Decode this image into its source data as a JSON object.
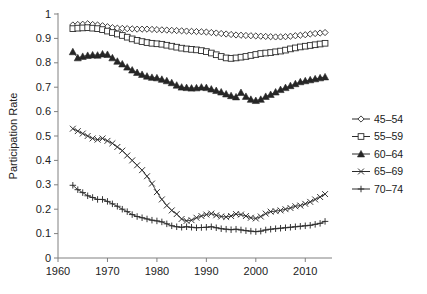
{
  "chart_data": {
    "type": "line",
    "title": "",
    "xlabel": "",
    "ylabel": "Participation Rate",
    "xlim": [
      1960,
      2015
    ],
    "ylim": [
      0,
      1
    ],
    "xticks": [
      1960,
      1970,
      1980,
      1990,
      2000,
      2010
    ],
    "yticks": [
      0,
      0.1,
      0.2,
      0.3,
      0.4,
      0.5,
      0.6,
      0.7,
      0.8,
      0.9,
      1
    ],
    "ytick_labels": [
      "0",
      "0.1",
      "0.2",
      "0.3",
      "0.4",
      "0.5",
      "0.6",
      "0.7",
      "0.8",
      "0.9",
      "1"
    ],
    "xtick_labels": [
      "1960",
      "1970",
      "1980",
      "1990",
      "2000",
      "2010"
    ],
    "grid": false,
    "legend_position": "right",
    "x": [
      1963,
      1964,
      1965,
      1966,
      1967,
      1968,
      1969,
      1970,
      1971,
      1972,
      1973,
      1974,
      1975,
      1976,
      1977,
      1978,
      1979,
      1980,
      1981,
      1982,
      1983,
      1984,
      1985,
      1986,
      1987,
      1988,
      1989,
      1990,
      1991,
      1992,
      1993,
      1994,
      1995,
      1996,
      1997,
      1998,
      1999,
      2000,
      2001,
      2002,
      2003,
      2004,
      2005,
      2006,
      2007,
      2008,
      2009,
      2010,
      2011,
      2012,
      2013,
      2014
    ],
    "series": [
      {
        "name": "45–54",
        "marker": "open-diamond",
        "values": [
          0.955,
          0.957,
          0.958,
          0.96,
          0.957,
          0.955,
          0.952,
          0.948,
          0.944,
          0.942,
          0.941,
          0.94,
          0.939,
          0.938,
          0.938,
          0.938,
          0.937,
          0.936,
          0.935,
          0.934,
          0.933,
          0.932,
          0.931,
          0.93,
          0.929,
          0.928,
          0.927,
          0.926,
          0.924,
          0.922,
          0.92,
          0.918,
          0.916,
          0.914,
          0.913,
          0.912,
          0.911,
          0.91,
          0.909,
          0.908,
          0.907,
          0.906,
          0.906,
          0.907,
          0.909,
          0.911,
          0.913,
          0.915,
          0.918,
          0.92,
          0.922,
          0.924
        ]
      },
      {
        "name": "55–59",
        "marker": "open-square",
        "values": [
          0.94,
          0.942,
          0.943,
          0.944,
          0.942,
          0.94,
          0.936,
          0.93,
          0.924,
          0.918,
          0.912,
          0.905,
          0.898,
          0.892,
          0.887,
          0.883,
          0.88,
          0.878,
          0.876,
          0.872,
          0.868,
          0.864,
          0.86,
          0.857,
          0.855,
          0.853,
          0.85,
          0.846,
          0.84,
          0.833,
          0.826,
          0.82,
          0.818,
          0.82,
          0.823,
          0.826,
          0.83,
          0.834,
          0.838,
          0.84,
          0.842,
          0.845,
          0.848,
          0.852,
          0.857,
          0.861,
          0.865,
          0.868,
          0.871,
          0.874,
          0.877,
          0.88
        ]
      },
      {
        "name": "60–64",
        "marker": "filled-triangle",
        "values": [
          0.845,
          0.82,
          0.826,
          0.83,
          0.832,
          0.831,
          0.836,
          0.834,
          0.82,
          0.806,
          0.795,
          0.782,
          0.77,
          0.76,
          0.752,
          0.745,
          0.74,
          0.738,
          0.732,
          0.726,
          0.718,
          0.708,
          0.7,
          0.698,
          0.696,
          0.697,
          0.7,
          0.698,
          0.692,
          0.686,
          0.68,
          0.672,
          0.665,
          0.66,
          0.678,
          0.662,
          0.65,
          0.645,
          0.65,
          0.662,
          0.67,
          0.68,
          0.69,
          0.698,
          0.706,
          0.714,
          0.722,
          0.726,
          0.73,
          0.734,
          0.738,
          0.742
        ]
      },
      {
        "name": "65–69",
        "marker": "x-cross",
        "values": [
          0.53,
          0.52,
          0.51,
          0.5,
          0.49,
          0.485,
          0.49,
          0.48,
          0.47,
          0.455,
          0.44,
          0.42,
          0.4,
          0.38,
          0.36,
          0.335,
          0.305,
          0.27,
          0.24,
          0.215,
          0.195,
          0.18,
          0.16,
          0.152,
          0.155,
          0.165,
          0.172,
          0.178,
          0.182,
          0.175,
          0.17,
          0.168,
          0.172,
          0.18,
          0.178,
          0.172,
          0.165,
          0.162,
          0.17,
          0.182,
          0.19,
          0.192,
          0.195,
          0.2,
          0.205,
          0.212,
          0.215,
          0.222,
          0.23,
          0.24,
          0.25,
          0.262
        ]
      },
      {
        "name": "70–74",
        "marker": "plus",
        "values": [
          0.298,
          0.28,
          0.268,
          0.255,
          0.248,
          0.24,
          0.24,
          0.232,
          0.222,
          0.212,
          0.2,
          0.19,
          0.178,
          0.17,
          0.165,
          0.16,
          0.155,
          0.152,
          0.148,
          0.14,
          0.132,
          0.128,
          0.126,
          0.128,
          0.126,
          0.124,
          0.125,
          0.126,
          0.128,
          0.124,
          0.12,
          0.118,
          0.116,
          0.118,
          0.115,
          0.112,
          0.11,
          0.108,
          0.11,
          0.115,
          0.118,
          0.12,
          0.122,
          0.124,
          0.126,
          0.128,
          0.13,
          0.132,
          0.134,
          0.138,
          0.142,
          0.15
        ]
      }
    ]
  },
  "legend": {
    "items": [
      {
        "label": "45–54",
        "marker": "open-diamond"
      },
      {
        "label": "55–59",
        "marker": "open-square"
      },
      {
        "label": "60–64",
        "marker": "filled-triangle"
      },
      {
        "label": "65–69",
        "marker": "x-cross"
      },
      {
        "label": "70–74",
        "marker": "plus"
      }
    ]
  },
  "colors": {
    "series_stroke": "#2b2b2b",
    "axis": "#808080",
    "text": "#222222",
    "background": "#ffffff"
  }
}
